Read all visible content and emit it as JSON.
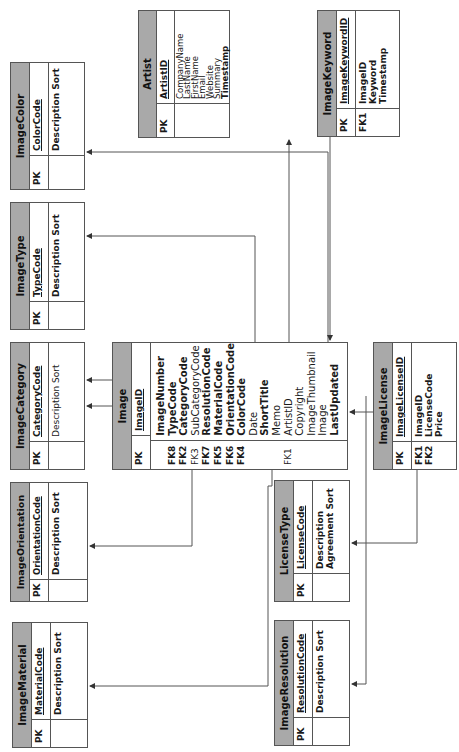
{
  "diagram": {
    "orientation": "rotated-90-ccw",
    "header_color": "#a9a9a9",
    "line_color": "#555555"
  },
  "entities": {
    "image_color": {
      "title": "ImageColor",
      "pk_label": "PK",
      "pk": "ColorCode",
      "attributes": [
        {
          "key": "",
          "name": "Description Sort",
          "bold": true
        }
      ]
    },
    "artist": {
      "title": "Artist",
      "pk_label": "PK",
      "pk": "ArtistID",
      "attributes": [
        {
          "key": "",
          "name": "CompanyName",
          "bold": false
        },
        {
          "key": "",
          "name": "LastName",
          "bold": false
        },
        {
          "key": "",
          "name": "FirstName",
          "bold": false
        },
        {
          "key": "",
          "name": "Email",
          "bold": false
        },
        {
          "key": "",
          "name": "Website",
          "bold": false
        },
        {
          "key": "",
          "name": "Summary",
          "bold": false
        },
        {
          "key": "",
          "name": "Timestamp",
          "bold": true
        }
      ]
    },
    "image_keyword": {
      "title": "ImageKeyword",
      "pk_label": "PK",
      "pk": "ImageKeywordID",
      "attributes": [
        {
          "key": "FK1",
          "name": "ImageID",
          "bold": true
        },
        {
          "key": "",
          "name": "Keyword",
          "bold": true
        },
        {
          "key": "",
          "name": "Timestamp",
          "bold": true
        }
      ]
    },
    "image_type": {
      "title": "ImageType",
      "pk_label": "PK",
      "pk": "TypeCode",
      "attributes": [
        {
          "key": "",
          "name": "Description Sort",
          "bold": true
        }
      ]
    },
    "image_category": {
      "title": "ImageCategory",
      "pk_label": "PK",
      "pk": "CategoryCode",
      "attributes": [
        {
          "key": "",
          "name": "Description Sort",
          "bold": false
        }
      ]
    },
    "image": {
      "title": "Image",
      "pk_label": "PK",
      "pk": "ImageID",
      "attributes": [
        {
          "key": "",
          "name": "ImageNumber",
          "bold": true
        },
        {
          "key": "FK8",
          "name": "TypeCode",
          "bold": true
        },
        {
          "key": "FK2",
          "name": "CategoryCode",
          "bold": true
        },
        {
          "key": "FK3",
          "name": "SubCategoryCode",
          "bold": false
        },
        {
          "key": "FK7",
          "name": "ResolutionCode",
          "bold": true
        },
        {
          "key": "FK5",
          "name": "MaterialCode",
          "bold": true
        },
        {
          "key": "FK6",
          "name": "OrientationCode",
          "bold": true
        },
        {
          "key": "FK4",
          "name": "ColorCode",
          "bold": true
        },
        {
          "key": "",
          "name": "Date",
          "bold": false
        },
        {
          "key": "",
          "name": "ShortTitle",
          "bold": true
        },
        {
          "key": "",
          "name": "Memo",
          "bold": false
        },
        {
          "key": "FK1",
          "name": "ArtistID",
          "bold": false
        },
        {
          "key": "",
          "name": "Copyright",
          "bold": false
        },
        {
          "key": "",
          "name": "ImageThumbnail",
          "bold": false
        },
        {
          "key": "",
          "name": "Image",
          "bold": false
        },
        {
          "key": "",
          "name": "LastUpdated",
          "bold": true
        }
      ]
    },
    "image_license": {
      "title": "ImageLicense",
      "pk_label": "PK",
      "pk": "ImageLicenseID",
      "attributes": [
        {
          "key": "FK1",
          "name": "ImageID",
          "bold": true
        },
        {
          "key": "FK2",
          "name": "LicenseCode",
          "bold": true
        },
        {
          "key": "",
          "name": "Price",
          "bold": true
        }
      ]
    },
    "image_orientation": {
      "title": "ImageOrientation",
      "pk_label": "PK",
      "pk": "OrientationCode",
      "attributes": [
        {
          "key": "",
          "name": "Description Sort",
          "bold": true
        }
      ]
    },
    "license_type": {
      "title": "LicenseType",
      "pk_label": "PK",
      "pk": "LicenseCode",
      "attributes": [
        {
          "key": "",
          "name": "Description",
          "bold": true
        },
        {
          "key": "",
          "name": "Agreement Sort",
          "bold": true
        }
      ]
    },
    "image_material": {
      "title": "ImageMaterial",
      "pk_label": "PK",
      "pk": "MaterialCode",
      "attributes": [
        {
          "key": "",
          "name": "Description Sort",
          "bold": true
        }
      ]
    },
    "image_resolution": {
      "title": "ImageResolution",
      "pk_label": "PK",
      "pk": "ResolutionCode",
      "attributes": [
        {
          "key": "",
          "name": "Description Sort",
          "bold": true
        }
      ]
    }
  },
  "relationships": [
    {
      "from": "Image",
      "to": "ImageColor",
      "via": "ColorCode"
    },
    {
      "from": "Image",
      "to": "Artist",
      "via": "ArtistID"
    },
    {
      "from": "ImageKeyword",
      "to": "Image",
      "via": "ImageID"
    },
    {
      "from": "Image",
      "to": "ImageType",
      "via": "TypeCode"
    },
    {
      "from": "Image",
      "to": "ImageCategory",
      "via": "CategoryCode"
    },
    {
      "from": "Image",
      "to": "ImageCategory",
      "via": "SubCategoryCode"
    },
    {
      "from": "ImageLicense",
      "to": "Image",
      "via": "ImageID"
    },
    {
      "from": "Image",
      "to": "ImageOrientation",
      "via": "OrientationCode"
    },
    {
      "from": "ImageLicense",
      "to": "LicenseType",
      "via": "LicenseCode"
    },
    {
      "from": "Image",
      "to": "ImageMaterial",
      "via": "MaterialCode"
    },
    {
      "from": "Image",
      "to": "ImageResolution",
      "via": "ResolutionCode"
    }
  ]
}
